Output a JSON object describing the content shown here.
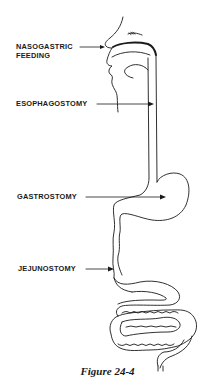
{
  "figure": {
    "caption": "Figure 24-4",
    "labels": [
      {
        "id": "nasogastric",
        "line1": "NASOGASTRIC",
        "line2": "FEEDING"
      },
      {
        "id": "esophagostomy",
        "line1": "ESOPHAGOSTOMY"
      },
      {
        "id": "gastrostomy",
        "line1": "GASTROSTOMY"
      },
      {
        "id": "jejunostomy",
        "line1": "JEJUNOSTOMY"
      }
    ],
    "stroke_color": "#1a1a1a",
    "background": "#ffffff"
  }
}
